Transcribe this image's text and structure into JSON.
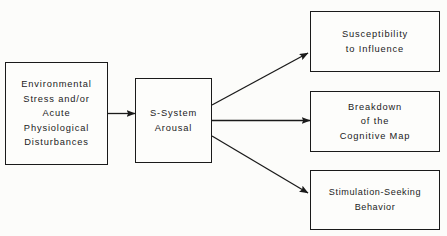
{
  "diagram": {
    "type": "flowchart",
    "background_color": "#fcfcfa",
    "line_color": "#1a1a1a",
    "nodes": [
      {
        "id": "environmental-stress",
        "lines": [
          "Environmental",
          "Stress and/or",
          "Acute",
          "Physiological",
          "Disturbances"
        ]
      },
      {
        "id": "s-system-arousal",
        "lines": [
          "S-System",
          "Arousal"
        ]
      },
      {
        "id": "susceptibility",
        "lines": [
          "Susceptibility",
          "to Influence"
        ]
      },
      {
        "id": "breakdown",
        "lines": [
          "Breakdown",
          "of the",
          "Cognitive Map"
        ]
      },
      {
        "id": "stimulation-seeking",
        "lines": [
          "Stimulation-Seeking",
          "Behavior"
        ]
      }
    ],
    "edges": [
      {
        "id": "stress-to-arousal",
        "from": "environmental-stress",
        "to": "s-system-arousal",
        "style": "straight-horizontal-arrow"
      },
      {
        "id": "arousal-to-susceptibility",
        "from": "s-system-arousal",
        "to": "susceptibility",
        "style": "diagonal-up-arrow"
      },
      {
        "id": "arousal-to-breakdown",
        "from": "s-system-arousal",
        "to": "breakdown",
        "style": "straight-horizontal-arrow"
      },
      {
        "id": "arousal-to-stimulation-seeking",
        "from": "s-system-arousal",
        "to": "stimulation-seeking",
        "style": "diagonal-down-arrow"
      }
    ]
  }
}
